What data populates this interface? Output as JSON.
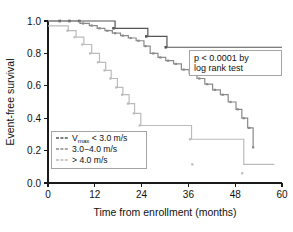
{
  "figure": {
    "background": "#ffffff",
    "width": 293,
    "height": 232
  },
  "annotation": {
    "pvalue_line1": "p < 0.0001 by",
    "pvalue_line2": "log rank test"
  },
  "legend": {
    "entries": [
      {
        "label_main": "V",
        "label_sub": "max",
        "label_rest": " < 3.0 m/s",
        "color": "#555555"
      },
      {
        "label_main": "3.0−4.0 m/s",
        "label_sub": "",
        "label_rest": "",
        "color": "#8a8a8a"
      },
      {
        "label_main": "> 4.0 m/s",
        "label_sub": "",
        "label_rest": "",
        "color": "#bbbbbb"
      }
    ]
  },
  "chart_data": {
    "type": "line",
    "title": "",
    "xlabel": "Time from enrollment (months)",
    "ylabel": "Event-free survival",
    "xlim": [
      0,
      60
    ],
    "ylim": [
      0.0,
      1.0
    ],
    "xticks": [
      0,
      12,
      24,
      36,
      48,
      60
    ],
    "xtick_labels": [
      "0",
      "12",
      "24",
      "36",
      "48",
      "60"
    ],
    "yticks": [
      0.0,
      0.2,
      0.4,
      0.6,
      0.8,
      1.0
    ],
    "ytick_labels": [
      "0.0",
      "0.2",
      "0.4",
      "0.6",
      "0.8",
      "1.0"
    ],
    "grid": false,
    "legend_position": "lower-left",
    "step_style": "post",
    "series": [
      {
        "name": "Vmax < 3.0 m/s",
        "color": "#555555",
        "marker": "square",
        "marker_size": 2.6,
        "x": [
          0,
          16.5,
          17.2,
          24.8,
          25.6,
          29.8,
          30.5,
          60.0
        ],
        "y": [
          1.0,
          1.0,
          0.955,
          0.955,
          0.905,
          0.905,
          0.838,
          0.838
        ],
        "censor_x": [
          3.0,
          5.5,
          8.0,
          16.8,
          25.2,
          30.2
        ],
        "censor_y": [
          1.0,
          1.0,
          1.0,
          0.955,
          0.905,
          0.838
        ]
      },
      {
        "name": "3.0-4.0 m/s",
        "color": "#8a8a8a",
        "marker": "square",
        "marker_size": 2.2,
        "x": [
          0,
          7.5,
          8.2,
          10.0,
          10.6,
          12.0,
          12.6,
          14.0,
          14.6,
          16.0,
          16.5,
          18.0,
          18.6,
          20.0,
          20.6,
          22.0,
          22.6,
          24.0,
          24.6,
          25.5,
          26.2,
          27.5,
          28.2,
          29.5,
          30.2,
          31.5,
          32.2,
          33.5,
          34.2,
          35.5,
          36.2,
          37.5,
          38.2,
          39.5,
          40.2,
          41.5,
          42.2,
          43.5,
          44.2,
          45.5,
          46.2,
          47.5,
          48.2,
          49.0,
          49.7,
          50.5,
          51.2,
          52.0,
          52.6
        ],
        "y": [
          1.0,
          1.0,
          0.985,
          0.985,
          0.972,
          0.972,
          0.955,
          0.955,
          0.94,
          0.94,
          0.925,
          0.925,
          0.91,
          0.91,
          0.895,
          0.895,
          0.878,
          0.878,
          0.845,
          0.845,
          0.8,
          0.8,
          0.775,
          0.775,
          0.755,
          0.755,
          0.735,
          0.735,
          0.7,
          0.7,
          0.675,
          0.675,
          0.645,
          0.645,
          0.61,
          0.61,
          0.575,
          0.575,
          0.545,
          0.545,
          0.5,
          0.5,
          0.455,
          0.455,
          0.4,
          0.4,
          0.34,
          0.34,
          0.22
        ],
        "censor_x": [
          9.0,
          11.2,
          13.2,
          15.2,
          17.2,
          19.2,
          21.2,
          23.2,
          25.0,
          27.0,
          28.8,
          30.8,
          32.8,
          34.8,
          36.8,
          38.8,
          40.8,
          42.8,
          44.8,
          46.8,
          48.6,
          50.2,
          51.6,
          52.6
        ],
        "censor_y": [
          0.985,
          0.972,
          0.955,
          0.94,
          0.925,
          0.91,
          0.895,
          0.878,
          0.845,
          0.8,
          0.775,
          0.755,
          0.735,
          0.7,
          0.675,
          0.645,
          0.61,
          0.575,
          0.545,
          0.5,
          0.455,
          0.4,
          0.34,
          0.22
        ]
      },
      {
        "name": "> 4.0 m/s",
        "color": "#bbbbbb",
        "marker": "square",
        "marker_size": 2.2,
        "x": [
          0,
          4.5,
          5.2,
          6.5,
          7.2,
          8.5,
          9.2,
          10.5,
          11.2,
          12.5,
          13.2,
          14.0,
          14.8,
          15.5,
          16.2,
          17.0,
          17.8,
          18.5,
          19.2,
          20.0,
          20.8,
          21.5,
          22.2,
          23.0,
          23.8,
          36.0,
          36.8,
          49.5,
          50.2,
          58.0
        ],
        "y": [
          0.97,
          0.97,
          0.94,
          0.94,
          0.9,
          0.9,
          0.855,
          0.855,
          0.8,
          0.8,
          0.745,
          0.745,
          0.695,
          0.695,
          0.645,
          0.645,
          0.59,
          0.59,
          0.545,
          0.545,
          0.49,
          0.49,
          0.43,
          0.43,
          0.355,
          0.355,
          0.27,
          0.27,
          0.115,
          0.115
        ],
        "censor_x": [
          5.0,
          6.8,
          8.8,
          10.8,
          12.8,
          14.5,
          16.0,
          17.5,
          19.0,
          20.5,
          22.0,
          23.5,
          24.0,
          36.4,
          37.0,
          49.8
        ],
        "censor_y": [
          0.94,
          0.9,
          0.855,
          0.8,
          0.745,
          0.695,
          0.645,
          0.59,
          0.545,
          0.49,
          0.43,
          0.355,
          0.27,
          0.27,
          0.115,
          0.06
        ]
      }
    ]
  }
}
